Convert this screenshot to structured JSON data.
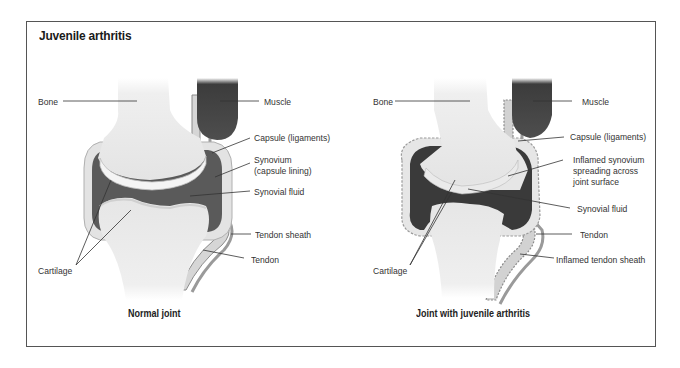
{
  "figure": {
    "title": "Juvenile arthritis",
    "colors": {
      "frame": "#555555",
      "bone": "#eeeeee",
      "muscle": "#4a4a4a",
      "synovium": "#5a5a5a",
      "synovium_inflamed": "#333333",
      "fluid": "#505050",
      "capsule": "#d8d8d8",
      "text": "#333333"
    }
  },
  "panels": [
    {
      "caption": "Normal joint",
      "labels": {
        "bone": "Bone",
        "muscle": "Muscle",
        "capsule": "Capsule (ligaments)",
        "synovium_line1": "Synovium",
        "synovium_line2": "(capsule lining)",
        "synovial_fluid": "Synovial fluid",
        "tendon_sheath": "Tendon sheath",
        "tendon": "Tendon",
        "cartilage": "Cartilage"
      }
    },
    {
      "caption": "Joint with juvenile arthritis",
      "labels": {
        "bone": "Bone",
        "muscle": "Muscle",
        "capsule": "Capsule (ligaments)",
        "synovium_line1": "Inflamed synovium",
        "synovium_line2": "spreading across",
        "synovium_line3": "joint surface",
        "synovial_fluid": "Synovial fluid",
        "tendon": "Tendon",
        "tendon_sheath": "Inflamed tendon sheath",
        "cartilage": "Cartilage"
      }
    }
  ]
}
